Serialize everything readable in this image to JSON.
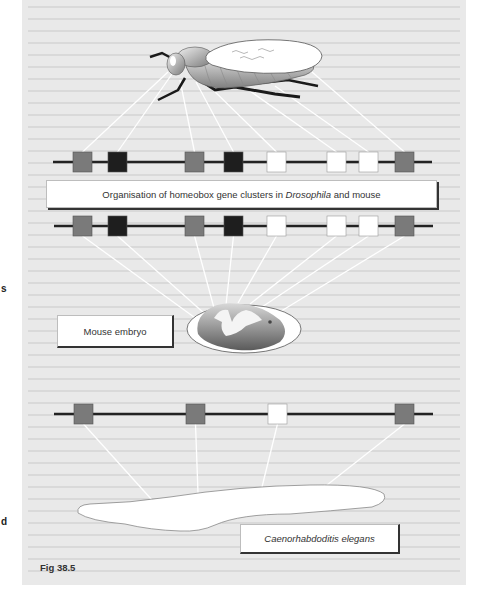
{
  "figure": {
    "caption": "Fig 38.5",
    "title_parts": {
      "before": "Organisation of homeobox gene clusters in ",
      "italic": "Drosophila",
      "after": " and mouse"
    },
    "mouse_label": "Mouse embryo",
    "worm_label": "Caenorhabdoditis elegans",
    "organisms": [
      "Drosophila (fruit fly)",
      "Mouse embryo",
      "Caenorhabdoditis elegans"
    ],
    "margin_marks": [
      "s",
      "d"
    ]
  },
  "colors": {
    "panel_bg": "#e9e9e9",
    "gene_gray": "#7a7a7a",
    "gene_black": "#1e1e1e",
    "gene_white": "#ffffff",
    "chromosome_line": "#222222",
    "connector": "#ffffff"
  },
  "gene_clusters": {
    "drosophila": [
      "gray",
      "black",
      "gray",
      "black",
      "white",
      "white",
      "white",
      "gray"
    ],
    "mouse": [
      "gray",
      "black",
      "gray",
      "black",
      "white",
      "white",
      "white",
      "gray"
    ],
    "c_elegans": [
      "gray",
      "gray",
      "white",
      "gray"
    ]
  }
}
